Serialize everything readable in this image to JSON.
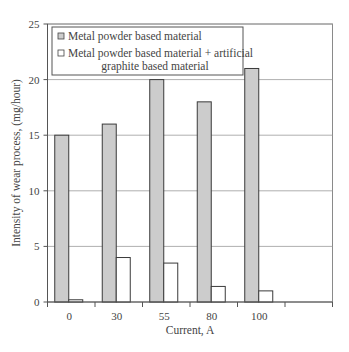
{
  "chart_data": {
    "type": "bar",
    "title": "",
    "xlabel": "Current, A",
    "ylabel": "Intensity of wear process, (mg/hour)",
    "categories": [
      "0",
      "30",
      "55",
      "80",
      "100",
      ""
    ],
    "series": [
      {
        "name": "Metal powder based material",
        "values": [
          15,
          16,
          20,
          18,
          21,
          null
        ],
        "color": "#cccccc"
      },
      {
        "name": "Metal powder based material + artificial graphite based material",
        "values": [
          0.2,
          4,
          3.5,
          1.4,
          1,
          null
        ],
        "color": "#ffffff"
      }
    ],
    "ylim": [
      0,
      25
    ],
    "yticks": [
      0,
      5,
      10,
      15,
      20,
      25
    ],
    "grid": true,
    "legend_position": "top-left inside",
    "legend": [
      {
        "lines": [
          "Metal powder based material"
        ]
      },
      {
        "lines": [
          "Metal powder based material + artificial",
          "graphite based material"
        ]
      }
    ]
  }
}
